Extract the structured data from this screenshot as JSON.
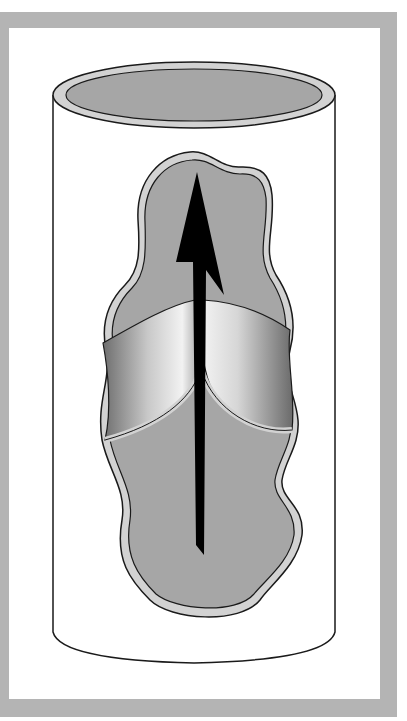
{
  "diagram": {
    "elements": [
      "frame",
      "vein-cylinder",
      "vein-lumen-opening",
      "cutaway-wall",
      "valve-leaflet-left",
      "valve-leaflet-right",
      "blood-flow-arrow"
    ],
    "colors": {
      "frame": "#b4b4b4",
      "background": "#ffffff",
      "lumen": "#a6a6a6",
      "wall_rim": "#d2d2d2",
      "outline": "#1a1a1a",
      "arrow": "#000000"
    },
    "arrow_direction": "up"
  }
}
